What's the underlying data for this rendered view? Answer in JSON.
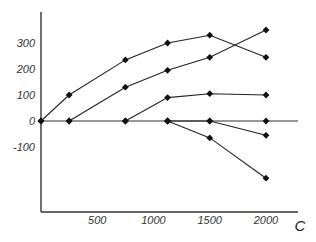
{
  "chart_data": {
    "type": "line",
    "title": "",
    "xlabel": "C",
    "ylabel": "",
    "xlim": [
      0,
      2300
    ],
    "ylim": [
      -290,
      390
    ],
    "grid": false,
    "legend": null,
    "x_ticks": [
      500,
      1000,
      1500,
      2000
    ],
    "x_tick_labels": [
      "500",
      "1000",
      "1500",
      "2000"
    ],
    "y_ticks": [
      300,
      200,
      100,
      0,
      -100
    ],
    "y_tick_labels": [
      "300",
      "200",
      "100",
      "0",
      "-100"
    ],
    "series": [
      {
        "name": "series-1",
        "points": [
          [
            0,
            0
          ],
          [
            250,
            100
          ],
          [
            750,
            235
          ],
          [
            1125,
            300
          ],
          [
            1500,
            330
          ],
          [
            2000,
            245
          ]
        ]
      },
      {
        "name": "series-2",
        "points": [
          [
            250,
            0
          ],
          [
            750,
            130
          ],
          [
            1125,
            195
          ],
          [
            1500,
            245
          ],
          [
            2000,
            350
          ]
        ]
      },
      {
        "name": "series-3",
        "points": [
          [
            750,
            0
          ],
          [
            1125,
            90
          ],
          [
            1500,
            105
          ],
          [
            2000,
            100
          ]
        ]
      },
      {
        "name": "series-4",
        "points": [
          [
            1125,
            0
          ],
          [
            1500,
            0
          ],
          [
            2000,
            -55
          ]
        ]
      },
      {
        "name": "series-5",
        "points": [
          [
            1125,
            0
          ],
          [
            1500,
            -65
          ],
          [
            2000,
            -220
          ]
        ]
      },
      {
        "name": "zero-line-points",
        "points": [
          [
            0,
            0
          ],
          [
            250,
            0
          ],
          [
            750,
            0
          ],
          [
            1125,
            0
          ],
          [
            1500,
            0
          ],
          [
            2000,
            0
          ]
        ]
      }
    ],
    "colors": {
      "line": "#222222",
      "marker": "#111111",
      "axis": "#333333"
    }
  }
}
